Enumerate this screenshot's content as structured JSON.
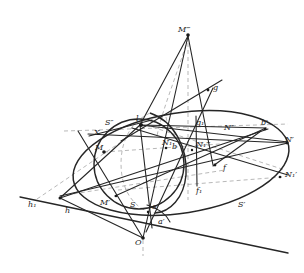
{
  "figure": {
    "background_color": "#ffffff",
    "solid_line_color": "#262626",
    "dashed_line_color": "#9a9a9a",
    "label_color": "#1a1a1a"
  },
  "labels": [
    {
      "id": "M3",
      "text": "M‴",
      "x": 178,
      "y": 30
    },
    {
      "id": "g",
      "text": "g",
      "x": 213,
      "y": 88
    },
    {
      "id": "g1",
      "text": "g₁",
      "x": 196,
      "y": 123
    },
    {
      "id": "S2",
      "text": "S″",
      "x": 105,
      "y": 123
    },
    {
      "id": "X",
      "text": "X",
      "x": 94,
      "y": 133
    },
    {
      "id": "l",
      "text": "l",
      "x": 136,
      "y": 119
    },
    {
      "id": "N2",
      "text": "N″",
      "x": 224,
      "y": 128
    },
    {
      "id": "bprime",
      "text": "b′",
      "x": 261,
      "y": 123
    },
    {
      "id": "Nprime",
      "text": "N′",
      "x": 285,
      "y": 140
    },
    {
      "id": "M",
      "text": "M",
      "x": 95,
      "y": 148
    },
    {
      "id": "N1",
      "text": "N₁",
      "x": 162,
      "y": 143
    },
    {
      "id": "b",
      "text": "b",
      "x": 172,
      "y": 147
    },
    {
      "id": "N13",
      "text": "N₁‴",
      "x": 196,
      "y": 145
    },
    {
      "id": "f",
      "text": "f",
      "x": 223,
      "y": 168
    },
    {
      "id": "N1prime",
      "text": "N₁′",
      "x": 285,
      "y": 175
    },
    {
      "id": "f1",
      "text": "f₁",
      "x": 196,
      "y": 191
    },
    {
      "id": "h1",
      "text": "h₁",
      "x": 28,
      "y": 205
    },
    {
      "id": "h",
      "text": "h",
      "x": 65,
      "y": 211
    },
    {
      "id": "Mprime",
      "text": "M′",
      "x": 100,
      "y": 203
    },
    {
      "id": "S",
      "text": "S",
      "x": 130,
      "y": 205
    },
    {
      "id": "a",
      "text": "a",
      "x": 152,
      "y": 207
    },
    {
      "id": "aprime",
      "text": "a′",
      "x": 158,
      "y": 222
    },
    {
      "id": "Sprime",
      "text": "S′",
      "x": 238,
      "y": 205
    },
    {
      "id": "O",
      "text": "O",
      "x": 135,
      "y": 243
    }
  ],
  "geometry": {
    "apex": {
      "name": "M-triple-prime",
      "x": 188,
      "y": 34
    },
    "origin": {
      "name": "O",
      "x": 143,
      "y": 238
    },
    "base_ellipse": {
      "cx": 181,
      "cy": 163,
      "rx": 109,
      "ry": 50,
      "rotation": -9
    },
    "sphere_circle": {
      "cx": 139,
      "cy": 164,
      "r": 45
    },
    "inner_ellipse": {
      "cx": 152,
      "cy": 163,
      "rx": 37,
      "ry": 50,
      "rotation": -3
    },
    "ground_line": {
      "x1": 20,
      "y1": 197,
      "x2": 288,
      "y2": 253
    },
    "vertical_axis": {
      "x1": 188,
      "y1": 34,
      "x2": 143,
      "y2": 253
    }
  }
}
